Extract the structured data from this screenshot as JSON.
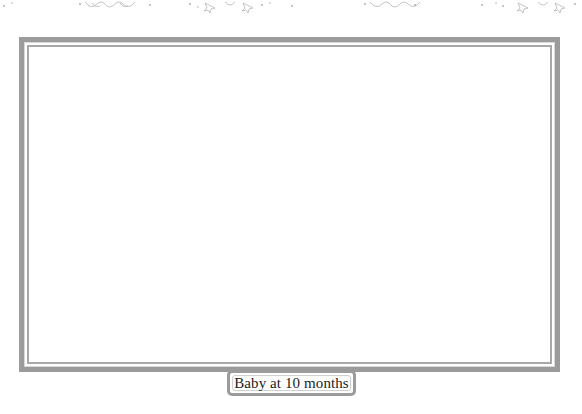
{
  "page": {
    "caption": "Baby at 10 months",
    "colors": {
      "frame": "#9b9b9b",
      "inner_line": "#a8a8a8",
      "background": "#ffffff",
      "text": "#222222"
    },
    "decorations": [
      "swirl-ornament",
      "stars-ornament",
      "swirl-ornament",
      "stars-ornament"
    ]
  }
}
